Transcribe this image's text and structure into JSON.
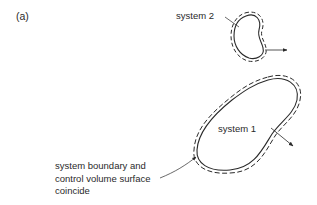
{
  "figure": {
    "panel_label": "(a)",
    "colors": {
      "line": "#2a2a2a",
      "background": "#ffffff"
    },
    "systems": [
      {
        "id": "system-2",
        "label": "system 2",
        "boundary_style": "solid line with dashed control-volume outline"
      },
      {
        "id": "system-1",
        "label": "system 1",
        "boundary_style": "solid line with dashed control-volume outline"
      }
    ],
    "annotation": {
      "lines": [
        "system boundary and",
        "control volume surface",
        "coincide"
      ]
    }
  }
}
